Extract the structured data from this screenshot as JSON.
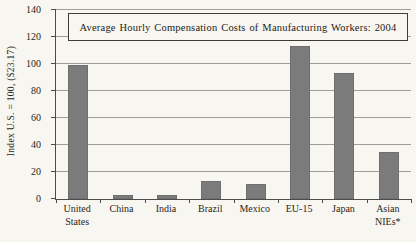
{
  "figure": {
    "background": "#f8f6f1",
    "bar_color": "#7b7b7b",
    "grid_color": "#a09d96",
    "axis_color": "#4d4d4d",
    "text_color": "#1e1a16"
  },
  "chart_data": {
    "type": "bar",
    "title": "Average Hourly Compensation Costs of Manufacturing Workers: 2004",
    "ylabel": "Index U.S. = 100, ($23.17)",
    "xlabel": "",
    "categories": [
      "United States",
      "China",
      "India",
      "Brazil",
      "Mexico",
      "EU-15",
      "Japan",
      "Asian NIEs*"
    ],
    "values": [
      99,
      3,
      3,
      13,
      11,
      113,
      93,
      35
    ],
    "ylim": [
      0,
      140
    ],
    "ytick_step": 20,
    "yticks": [
      0,
      20,
      40,
      60,
      80,
      100,
      120,
      140
    ],
    "grid": true,
    "legend": false,
    "bar_count": 8
  }
}
